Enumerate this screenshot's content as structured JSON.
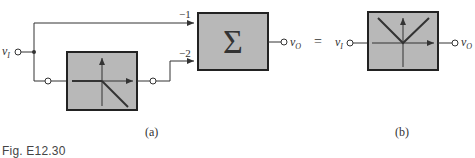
{
  "figure": {
    "caption": "Fig. E12.30",
    "part_a_label": "(a)",
    "part_b_label": "(b)"
  },
  "diagram_a": {
    "input_label": "vI",
    "input_sub": "I",
    "output_label": "vO",
    "output_sub": "O",
    "summer_symbol": "Σ",
    "gain_top": "−1",
    "gain_bottom": "−2",
    "block_transfer": "zero for negative input, negative slope for positive input"
  },
  "equals_sign": "=",
  "diagram_b": {
    "input_label": "vI",
    "input_sub": "I",
    "output_label": "vO",
    "output_sub": "O",
    "block_transfer": "V-shaped absolute value"
  },
  "colors": {
    "block_fill": "#b8b8b8",
    "line": "#333333",
    "background": "#ffffff"
  }
}
